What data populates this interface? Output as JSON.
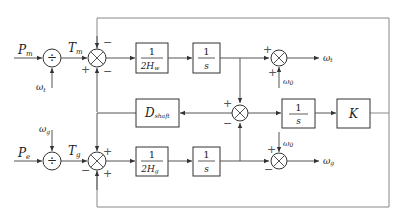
{
  "diagram": {
    "type": "block-diagram",
    "inputs": {
      "top": {
        "label": "P",
        "sub": "m"
      },
      "bottom": {
        "label": "P",
        "sub": "e"
      }
    },
    "dividers": {
      "top": {
        "symbol": "÷",
        "side_input": {
          "label": "ω",
          "sub": "t"
        },
        "output": {
          "label": "T",
          "sub": "m"
        }
      },
      "bottom": {
        "symbol": "÷",
        "side_input": {
          "label": "ω",
          "sub": "g"
        },
        "output": {
          "label": "T",
          "sub": "g"
        }
      }
    },
    "summing_junctions": {
      "top_left": {
        "signs": {
          "top": "−",
          "left": "+",
          "bottom": "−"
        }
      },
      "bottom_left": {
        "signs": {
          "top": "+",
          "left": "−",
          "bottom": "+"
        }
      },
      "middle": {
        "signs": {
          "top": "+",
          "bottom": "−"
        }
      },
      "top_right": {
        "signs": {
          "left": "+",
          "bottom": "+"
        },
        "side_input": {
          "label": "ω",
          "sub": "0"
        }
      },
      "bottom_right": {
        "signs": {
          "top": "+",
          "left": "−"
        },
        "side_input": {
          "label": "ω",
          "sub": "0"
        }
      }
    },
    "blocks": {
      "inertia_turbine": {
        "numerator": "1",
        "denominator": "2H",
        "den_sub": "w"
      },
      "integrator_top": {
        "numerator": "1",
        "denominator": "s"
      },
      "damping": {
        "label": "D",
        "sub": "shaft"
      },
      "integrator_mid": {
        "numerator": "1",
        "denominator": "s"
      },
      "stiffness": {
        "label": "K"
      },
      "inertia_generator": {
        "numerator": "1",
        "denominator": "2H",
        "den_sub": "g"
      },
      "integrator_bottom": {
        "numerator": "1",
        "denominator": "s"
      }
    },
    "outputs": {
      "top": {
        "label": "ω",
        "sub": "t"
      },
      "bottom": {
        "label": "ω",
        "sub": "g"
      }
    }
  }
}
